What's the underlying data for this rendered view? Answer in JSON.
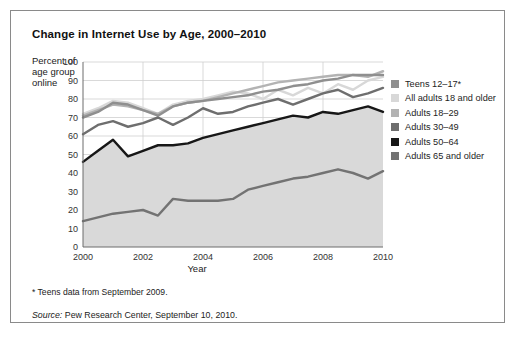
{
  "figure": {
    "title": "Change in Internet Use by Age, 2000–2010",
    "footnote": "* Teens data from September 2009.",
    "source_label": "Source:",
    "source_text": " Pew Research Center, September 10, 2010."
  },
  "chart_data": {
    "type": "line",
    "title": "Change in Internet Use by Age, 2000–2010",
    "xlabel": "Year",
    "ylabel": "Percent of age group online",
    "xlim": [
      2000,
      2010
    ],
    "ylim": [
      0,
      100
    ],
    "ytick_step": 10,
    "xtick_step": 2,
    "grid": true,
    "legend_position": "right",
    "yticks": [
      "100",
      "90",
      "80",
      "70",
      "60",
      "50",
      "40",
      "30",
      "20",
      "10",
      "0"
    ],
    "xticks": [
      "2000",
      "2002",
      "2004",
      "2006",
      "2008",
      "2010"
    ],
    "x": [
      2000,
      2000.5,
      2001,
      2001.5,
      2002,
      2002.5,
      2003,
      2003.5,
      2004,
      2004.5,
      2005,
      2005.5,
      2006,
      2006.5,
      2007,
      2007.5,
      2008,
      2008.5,
      2009,
      2009.5,
      2010
    ],
    "series": [
      {
        "name": "Teens 12–17*",
        "color": "#8f8f8f",
        "values": [
          70,
          73,
          78,
          77,
          74,
          71,
          76,
          78,
          79,
          80,
          81,
          82,
          84,
          85,
          87,
          88,
          90,
          91,
          93,
          93,
          93
        ]
      },
      {
        "name": "All adults 18 and older",
        "color": "#d8d8d8",
        "values": [
          72,
          75,
          79,
          78,
          75,
          72,
          77,
          79,
          80,
          82,
          84,
          83,
          80,
          85,
          82,
          86,
          83,
          88,
          85,
          90,
          92
        ]
      },
      {
        "name": "Adults 18–29",
        "color": "#b3b3b3",
        "values": [
          71,
          74,
          77,
          76,
          74,
          72,
          76,
          78,
          79,
          81,
          83,
          85,
          87,
          89,
          90,
          91,
          92,
          93,
          93,
          92,
          95
        ]
      },
      {
        "name": "Adults 30–49",
        "color": "#6e6e6e",
        "values": [
          61,
          66,
          68,
          65,
          67,
          70,
          66,
          70,
          75,
          72,
          73,
          76,
          78,
          80,
          77,
          80,
          83,
          85,
          81,
          83,
          86
        ]
      },
      {
        "name": "Adults 50–64",
        "color": "#171717",
        "values": [
          46,
          52,
          58,
          49,
          52,
          55,
          55,
          56,
          59,
          61,
          63,
          65,
          67,
          69,
          71,
          70,
          73,
          72,
          74,
          76,
          73
        ]
      },
      {
        "name": "Adults 65 and older",
        "color": "#737373",
        "values": [
          14,
          16,
          18,
          19,
          20,
          17,
          26,
          25,
          25,
          25,
          26,
          31,
          33,
          35,
          37,
          38,
          40,
          42,
          40,
          37,
          41
        ]
      }
    ]
  }
}
